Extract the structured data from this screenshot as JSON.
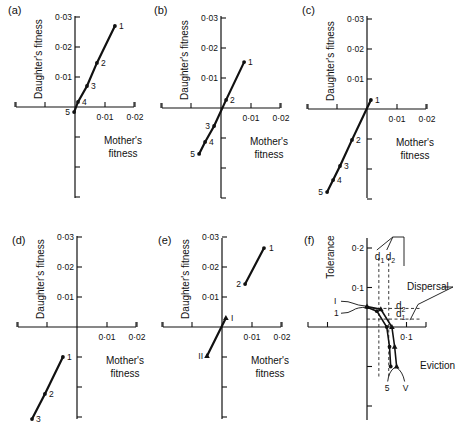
{
  "chart_data": [
    {
      "panel": "(a)",
      "type": "line",
      "xlabel": "Mother's fitness",
      "ylabel": "Daughter's fitness",
      "xticks": [
        "0·01",
        "0·02"
      ],
      "yticks": [
        "0·01",
        "0·02",
        "0·03"
      ],
      "xlim": [
        -0.02,
        0.02
      ],
      "ylim": [
        -0.03,
        0.03
      ],
      "points": [
        {
          "label": "1",
          "x": 0.0133,
          "y": 0.027
        },
        {
          "label": "2",
          "x": 0.0073,
          "y": 0.0147
        },
        {
          "label": "3",
          "x": 0.004,
          "y": 0.007
        },
        {
          "label": "4",
          "x": 0.001,
          "y": 0.0017
        },
        {
          "label": "5",
          "x": -0.0003,
          "y": -0.0017
        }
      ]
    },
    {
      "panel": "(b)",
      "type": "line",
      "xlabel": "Mother's fitness",
      "ylabel": "Daughter's fitness",
      "xticks": [
        "0·01",
        "0·02"
      ],
      "yticks": [
        "0·01",
        "0·02",
        "0·03"
      ],
      "xlim": [
        -0.02,
        0.02
      ],
      "ylim": [
        -0.03,
        0.03
      ],
      "points": [
        {
          "label": "1",
          "x": 0.0077,
          "y": 0.0153
        },
        {
          "label": "2",
          "x": 0.0017,
          "y": 0.0027
        },
        {
          "label": "3",
          "x": -0.0023,
          "y": -0.006
        },
        {
          "label": "4",
          "x": -0.0053,
          "y": -0.0113
        },
        {
          "label": "5",
          "x": -0.0073,
          "y": -0.0153
        }
      ]
    },
    {
      "panel": "(c)",
      "type": "line",
      "xlabel": "Mother's fitness",
      "ylabel": "Daughter's fitness",
      "xticks": [
        "0·01",
        "0·02"
      ],
      "yticks": [
        "0·01",
        "0·02",
        "0·03"
      ],
      "xlim": [
        -0.02,
        0.02
      ],
      "ylim": [
        -0.03,
        0.03
      ],
      "points": [
        {
          "label": "1",
          "x": 0.0013,
          "y": 0.003
        },
        {
          "label": "2",
          "x": -0.005,
          "y": -0.0103
        },
        {
          "label": "3",
          "x": -0.009,
          "y": -0.019
        },
        {
          "label": "4",
          "x": -0.0113,
          "y": -0.0237
        },
        {
          "label": "5",
          "x": -0.0133,
          "y": -0.0277
        }
      ]
    },
    {
      "panel": "(d)",
      "type": "line",
      "xlabel": "Mother's fitness",
      "ylabel": "Daughter's fitness",
      "xticks": [
        "0·01",
        "0·02"
      ],
      "yticks": [
        "0·01",
        "0·02",
        "0·03"
      ],
      "xlim": [
        -0.02,
        0.02
      ],
      "ylim": [
        -0.03,
        0.03
      ],
      "points": [
        {
          "label": "1",
          "x": -0.0047,
          "y": -0.01
        },
        {
          "label": "2",
          "x": -0.0107,
          "y": -0.0223
        },
        {
          "label": "3",
          "x": -0.015,
          "y": -0.0307
        }
      ]
    },
    {
      "panel": "(e)",
      "type": "line",
      "xlabel": "Mother's fitness",
      "ylabel": "Daughter's fitness",
      "xticks": [
        "0·01",
        "0·02"
      ],
      "yticks": [
        "0·01",
        "0·02",
        "0·03"
      ],
      "xlim": [
        -0.02,
        0.02
      ],
      "ylim": [
        -0.03,
        0.03
      ],
      "series": [
        {
          "name": "circles",
          "marker": "circle",
          "points": [
            {
              "label": "1",
              "x": 0.014,
              "y": 0.0263
            },
            {
              "label": "2",
              "x": 0.0077,
              "y": 0.0143
            }
          ]
        },
        {
          "name": "triangles",
          "marker": "triangle",
          "points": [
            {
              "label": "I",
              "x": 0.0013,
              "y": 0.003
            },
            {
              "label": "II",
              "x": -0.005,
              "y": -0.0097
            }
          ]
        }
      ]
    },
    {
      "panel": "(f)",
      "type": "line",
      "xlabel": "Eviction",
      "ylabel": "Tolerance",
      "xticks": [
        "0·1"
      ],
      "yticks": [
        "0·1",
        "0·2"
      ],
      "xlim": [
        -0.15,
        0.15
      ],
      "ylim": [
        -0.24,
        0.22
      ],
      "series": [
        {
          "name": "1–5 (circles)",
          "marker": "circle",
          "start_label": "1",
          "end_label": "5",
          "points": [
            {
              "x": 0.0,
              "y": 0.05
            },
            {
              "x": 0.025,
              "y": 0.04
            },
            {
              "x": 0.05,
              "y": 0.0
            },
            {
              "x": 0.057,
              "y": -0.05
            },
            {
              "x": 0.06,
              "y": -0.1
            }
          ]
        },
        {
          "name": "I–V (triangles)",
          "marker": "triangle",
          "start_label": "I",
          "end_label": "V",
          "points": [
            {
              "x": 0.0,
              "y": 0.052
            },
            {
              "x": 0.035,
              "y": 0.045
            },
            {
              "x": 0.063,
              "y": 0.0
            },
            {
              "x": 0.07,
              "y": -0.05
            },
            {
              "x": 0.075,
              "y": -0.1
            }
          ]
        }
      ],
      "reference_lines": [
        {
          "label": "d1",
          "orientation": "vertical",
          "value": 0.03
        },
        {
          "label": "d2",
          "orientation": "vertical",
          "value": 0.055
        },
        {
          "label": "d2",
          "orientation": "horizontal",
          "value": 0.047
        },
        {
          "label": "d1",
          "orientation": "horizontal",
          "value": 0.02
        }
      ],
      "annotations": [
        "Dispersal",
        "d1",
        "d2"
      ]
    }
  ],
  "labels": {
    "mother": "Mother's",
    "fitness": "fitness",
    "daughter": "Daughter's fitness",
    "tolerance": "Tolerance",
    "eviction": "Eviction",
    "dispersal": "Dispersal"
  }
}
